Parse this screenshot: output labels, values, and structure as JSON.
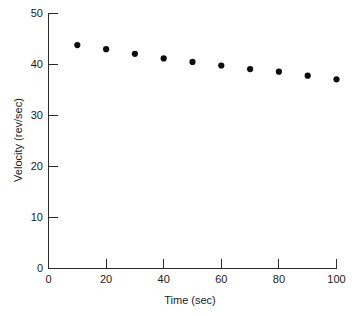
{
  "chart_data": {
    "type": "scatter",
    "title": "",
    "xlabel": "Time (sec)",
    "ylabel": "Velocity (rev/sec)",
    "x": [
      10,
      20,
      30,
      40,
      50,
      60,
      70,
      80,
      90,
      100
    ],
    "values": [
      43.8,
      43.0,
      42.1,
      41.2,
      40.5,
      39.8,
      39.1,
      38.6,
      37.8,
      37.1
    ],
    "series": [
      {
        "name": "Velocity",
        "values": [
          43.8,
          43.0,
          42.1,
          41.2,
          40.5,
          39.8,
          39.1,
          38.6,
          37.8,
          37.1
        ]
      }
    ],
    "xlim": [
      0,
      100
    ],
    "ylim": [
      0,
      50
    ],
    "xticks": [
      0,
      20,
      40,
      60,
      80,
      100
    ],
    "yticks": [
      0,
      10,
      20,
      30,
      40,
      50
    ],
    "xtick_labels": [
      "0",
      "20",
      "40",
      "60",
      "80",
      "100"
    ],
    "ytick_labels": [
      "0",
      "10",
      "20",
      "30",
      "40",
      "50"
    ],
    "grid": false,
    "legend": null,
    "marker_color": "#0d0d0d",
    "axis_color": "#2a2a2a",
    "background_color": "#ffffff"
  },
  "figure": {
    "xlabel": "Time (sec)",
    "ylabel": "Velocity (rev/sec)"
  }
}
